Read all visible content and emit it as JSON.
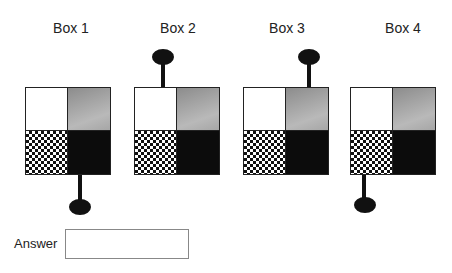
{
  "boxes": [
    {
      "title": "Box 1",
      "pin": "bottom-left"
    },
    {
      "title": "Box 2",
      "pin": "top-left"
    },
    {
      "title": "Box 3",
      "pin": "top-right"
    },
    {
      "title": "Box 4",
      "pin": "bottom-left"
    }
  ],
  "quadrants": {
    "top_left": "white",
    "top_right": "gray gradient",
    "bottom_left": "checkerboard",
    "bottom_right": "black"
  },
  "answer": {
    "label": "Answer",
    "value": ""
  },
  "colors": {
    "outline": "#222222",
    "dark_fill": "#0c0c0c",
    "gray_fill": "#a8a8a8"
  }
}
